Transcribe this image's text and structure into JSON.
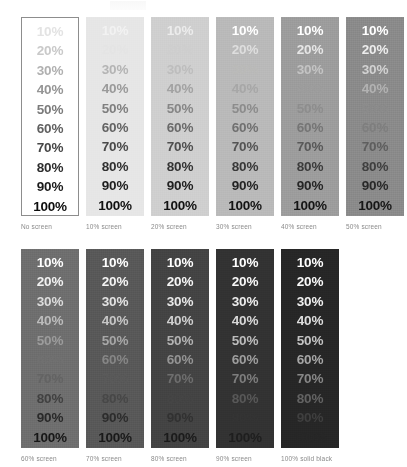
{
  "figure": {
    "tint_labels": [
      "10%",
      "20%",
      "30%",
      "40%",
      "50%",
      "60%",
      "70%",
      "80%",
      "90%",
      "100%"
    ],
    "caption_color": "#8a8a8a",
    "page_background": "#ffffff",
    "border_color": "#8d8d8d"
  },
  "rows": [
    {
      "name": "row-top",
      "columns": [
        {
          "caption": "No screen",
          "screen_percent": 0,
          "background": "#ffffff",
          "bordered": true,
          "text_colors": [
            "#e3e3e3",
            "#c9c9c9",
            "#b0b0b0",
            "#959595",
            "#7b7b7b",
            "#606060",
            "#474747",
            "#2d2d2d",
            "#1a1a1a",
            "#0d0d0d"
          ]
        },
        {
          "caption": "10% screen",
          "screen_percent": 10,
          "background": "#e6e6e6",
          "bordered": false,
          "text_colors": [
            "#f2f2f2",
            "#e4e4e4",
            "#b4b4b4",
            "#9a9a9a",
            "#7f7f7f",
            "#646464",
            "#4a4a4a",
            "#303030",
            "#1d1d1d",
            "#101010"
          ]
        },
        {
          "caption": "20% screen",
          "screen_percent": 20,
          "background": "#cfcfcf",
          "bordered": false,
          "text_colors": [
            "#ececec",
            "#cecece",
            "#bdbdbd",
            "#a2a2a2",
            "#868686",
            "#6a6a6a",
            "#4f4f4f",
            "#343434",
            "#202020",
            "#121212"
          ]
        },
        {
          "caption": "30% screen",
          "screen_percent": 30,
          "background": "#b9b9b9",
          "bordered": false,
          "text_colors": [
            "#ffffff",
            "#dedede",
            "#babab8",
            "#a7a7a7",
            "#8c8c8c",
            "#707070",
            "#545454",
            "#383838",
            "#232323",
            "#141414"
          ]
        },
        {
          "caption": "40% screen",
          "screen_percent": 40,
          "background": "#9c9c9c",
          "bordered": false,
          "text_colors": [
            "#ffffff",
            "#e6e6e6",
            "#c4c4c4",
            "#9d9d9d",
            "#8d8d8d",
            "#757575",
            "#585858",
            "#3b3b3b",
            "#252525",
            "#151515"
          ]
        },
        {
          "caption": "50% screen",
          "screen_percent": 50,
          "background": "#8a8a8a",
          "bordered": false,
          "text_colors": [
            "#ffffff",
            "#ededed",
            "#d2d2d2",
            "#b2b2b2",
            "#8b8b8b",
            "#7e7e7e",
            "#5e5e5e",
            "#3f3f3f",
            "#282828",
            "#161616"
          ]
        }
      ]
    },
    {
      "name": "row-bottom",
      "columns": [
        {
          "caption": "60% screen",
          "screen_percent": 60,
          "background": "#6e6e6e",
          "bordered": false,
          "text_colors": [
            "#ffffff",
            "#f2f2f2",
            "#dcdcdc",
            "#bcbcbc",
            "#9c9c9c",
            "#707070",
            "#636363",
            "#414141",
            "#292929",
            "#171717"
          ]
        },
        {
          "caption": "70% screen",
          "screen_percent": 70,
          "background": "#585858",
          "bordered": false,
          "text_colors": [
            "#ffffff",
            "#f4f4f4",
            "#e2e2e2",
            "#c6c6c6",
            "#a7a7a7",
            "#868686",
            "#5a5a5a",
            "#474747",
            "#2c2c2c",
            "#191919"
          ]
        },
        {
          "caption": "80% screen",
          "screen_percent": 80,
          "background": "#434343",
          "bordered": false,
          "text_colors": [
            "#ffffff",
            "#f6f6f6",
            "#e8e8e8",
            "#d0d0d0",
            "#b3b3b3",
            "#949494",
            "#6e6e6e",
            "#454545",
            "#313131",
            "#1b1b1b"
          ]
        },
        {
          "caption": "90% screen",
          "screen_percent": 90,
          "background": "#323232",
          "bordered": false,
          "text_colors": [
            "#ffffff",
            "#f8f8f8",
            "#ececec",
            "#d8d8d8",
            "#bcbcbc",
            "#9e9e9e",
            "#7d7d7d",
            "#585858",
            "#343434",
            "#1e1e1e"
          ]
        },
        {
          "caption": "100% solid black",
          "screen_percent": 100,
          "background": "#262626",
          "bordered": false,
          "text_colors": [
            "#ffffff",
            "#fafafa",
            "#f0f0f0",
            "#dedede",
            "#c4c4c4",
            "#a6a6a6",
            "#878787",
            "#636363",
            "#3f3f3f",
            "#272727"
          ]
        }
      ]
    }
  ]
}
